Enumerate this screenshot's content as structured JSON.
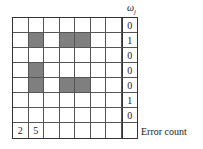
{
  "header_label": "ω_j",
  "omega_symbol": "ω",
  "omega_sub": "j",
  "footer_label": "Error count",
  "grid": {
    "rows": 8,
    "cols": 8,
    "filled_color": "#7f7f7f",
    "filled": [
      [
        1,
        1
      ],
      [
        1,
        3
      ],
      [
        1,
        4
      ],
      [
        3,
        1
      ],
      [
        4,
        1
      ],
      [
        4,
        3
      ],
      [
        4,
        4
      ]
    ],
    "omega_values": [
      "0",
      "1",
      "0",
      "0",
      "0",
      "1",
      "0"
    ],
    "error_counts": [
      "2",
      "5",
      "",
      "",
      "",
      "",
      "",
      ""
    ]
  }
}
